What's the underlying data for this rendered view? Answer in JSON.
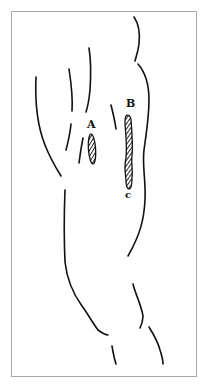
{
  "figure": {
    "type": "anatomical line drawing",
    "border_color": "#a8a8a8",
    "ink_color": "#111111",
    "labels": [
      {
        "id": "A",
        "text": "A",
        "x": 87,
        "y": 119
      },
      {
        "id": "B",
        "text": "B",
        "x": 126,
        "y": 98
      },
      {
        "id": "C",
        "text": "c",
        "x": 125,
        "y": 190
      }
    ],
    "marks": [
      {
        "id": "A",
        "shape": "hatched ellipse"
      },
      {
        "id": "B-C",
        "shape": "hatched twisted band"
      }
    ]
  }
}
